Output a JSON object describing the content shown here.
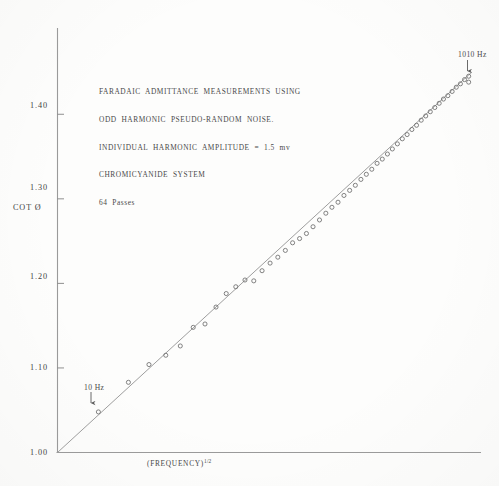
{
  "caption": {
    "lines": [
      "FARADAIC  ADMITTANCE  MEASUREMENTS  USING",
      "ODD  HARMONIC  PSEUDO-RANDOM  NOISE.",
      "INDIVIDUAL  HARMONIC  AMPLITUDE  =  1.5  mv",
      "CHROMICYANIDE  SYSTEM",
      "64  Passes"
    ]
  },
  "annotations": {
    "low_frequency": "10 Hz",
    "high_frequency": "1010 Hz"
  },
  "chart_data": {
    "type": "scatter",
    "title": "",
    "xlabel": "(FREQUENCY)",
    "xlabel_exponent": "1/2",
    "ylabel": "COT Ø",
    "ylim": [
      1.0,
      1.45
    ],
    "xlim": [
      0,
      32.5
    ],
    "grid": false,
    "legend": null,
    "ytick_labels": [
      "1.00",
      "1.10",
      "1.20",
      "1.30",
      "1.40"
    ],
    "ytick_values": [
      1.0,
      1.1,
      1.2,
      1.3,
      1.4
    ],
    "xtick_labels": [],
    "fit_line": {
      "intercept": 1.0,
      "slope": 0.01405,
      "x_start": 0.0,
      "x_end": 32.0
    },
    "marker": "open-circle",
    "series": [
      {
        "name": "cot Ø vs (frequency)^1/2",
        "x": [
          3.16,
          5.48,
          7.07,
          8.37,
          9.49,
          10.49,
          11.4,
          12.25,
          13.04,
          13.78,
          14.49,
          15.17,
          15.81,
          16.43,
          17.03,
          17.61,
          18.17,
          18.71,
          19.24,
          19.75,
          20.25,
          20.74,
          21.21,
          21.68,
          22.14,
          22.58,
          23.02,
          23.45,
          23.87,
          24.29,
          24.7,
          25.1,
          25.5,
          25.88,
          26.27,
          26.65,
          27.02,
          27.39,
          27.75,
          28.11,
          28.46,
          28.81,
          29.16,
          29.5,
          29.83,
          30.17,
          30.5,
          30.82,
          31.14,
          31.46,
          31.78,
          31.78
        ],
        "y": [
          1.048,
          1.083,
          1.104,
          1.115,
          1.126,
          1.148,
          1.152,
          1.172,
          1.188,
          1.196,
          1.204,
          1.203,
          1.215,
          1.224,
          1.231,
          1.239,
          1.248,
          1.253,
          1.259,
          1.267,
          1.275,
          1.283,
          1.29,
          1.296,
          1.304,
          1.31,
          1.316,
          1.323,
          1.329,
          1.335,
          1.342,
          1.347,
          1.353,
          1.359,
          1.365,
          1.371,
          1.376,
          1.382,
          1.387,
          1.393,
          1.398,
          1.403,
          1.408,
          1.413,
          1.418,
          1.422,
          1.427,
          1.432,
          1.436,
          1.441,
          1.445,
          1.438
        ]
      }
    ]
  },
  "axes": {
    "origin_label": "1.00"
  },
  "colors": {
    "ink": "#4a4a4a",
    "axis": "#8a8a8a",
    "marker": "#6d6d6d",
    "paper": "#fdfdfc"
  }
}
